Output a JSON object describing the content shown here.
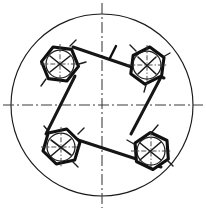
{
  "figure": {
    "title": "Belt drive mechanism schematic",
    "type": "engineering-line-drawing",
    "background_color": "#ffffff",
    "line_color": "#161616",
    "centerline_color": "#3a3a3a",
    "canvas": {
      "width": 206,
      "height": 211
    }
  },
  "outer_circle": {
    "label": "outer housing circle",
    "cx": 102,
    "cy": 105,
    "r": 91,
    "stroke_width": 1.15
  },
  "centerlines": {
    "horizontal": {
      "label": "horizontal centerline",
      "x1": 3,
      "y1": 105,
      "x2": 203,
      "y2": 105
    },
    "vertical": {
      "label": "vertical centerline",
      "x1": 102,
      "y1": 3,
      "x2": 102,
      "y2": 208
    }
  },
  "pulleys": [
    {
      "id": "pulley-top-left",
      "label": "Top-left pulley",
      "cx": 58,
      "cy": 62,
      "hex_radius": 21,
      "hub_radius": 14,
      "hex_rotation": 12,
      "spoke_count": 3
    },
    {
      "id": "pulley-top-right",
      "label": "Top-right pulley",
      "cx": 146,
      "cy": 62,
      "hex_radius": 21,
      "hub_radius": 14,
      "hex_rotation": 20,
      "spoke_count": 3
    },
    {
      "id": "pulley-bottom-left",
      "label": "Bottom-left pulley",
      "cx": 60,
      "cy": 147,
      "hex_radius": 21,
      "hub_radius": 14,
      "hex_rotation": 8,
      "spoke_count": 3
    },
    {
      "id": "pulley-bottom-right",
      "label": "Bottom-right pulley",
      "cx": 147,
      "cy": 148,
      "hex_radius": 21,
      "hub_radius": 14,
      "hex_rotation": 15,
      "spoke_count": 3
    }
  ],
  "belts": [
    {
      "id": "belt-top",
      "label": "Top belt span",
      "from": "pulley-top-left",
      "to": "pulley-top-right",
      "x1": 73,
      "y1": 47,
      "x2": 163,
      "y2": 77
    },
    {
      "id": "belt-left",
      "label": "Left belt span",
      "from": "pulley-top-left",
      "to": "pulley-bottom-left",
      "x1": 74,
      "y1": 76,
      "x2": 46,
      "y2": 133
    },
    {
      "id": "belt-bottom",
      "label": "Bottom belt span",
      "from": "pulley-bottom-left",
      "to": "pulley-bottom-right",
      "x1": 75,
      "y1": 138,
      "x2": 160,
      "y2": 166
    },
    {
      "id": "belt-right",
      "label": "Right belt span",
      "from": "pulley-top-right",
      "to": "pulley-bottom-right",
      "x1": 160,
      "y1": 76,
      "x2": 132,
      "y2": 133
    }
  ],
  "markers": [
    {
      "id": "marker-tension-top",
      "label": "Tension / direction tick on top belt",
      "x": 110,
      "y": 58,
      "length": 13,
      "angle": -62
    }
  ]
}
